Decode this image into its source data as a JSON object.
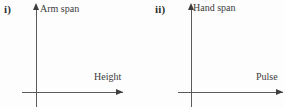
{
  "page": {
    "background_color": "#fdfdfd",
    "ink_color": "#3b3b3b",
    "axis_color": "#5a5a5a"
  },
  "panels": [
    {
      "marker": "i)",
      "y_axis_label": "Arm span",
      "x_axis_label": "Height",
      "y_arrow_icon": "arrow-up-icon",
      "x_arrow_icon": "arrow-right-icon"
    },
    {
      "marker": "ii)",
      "y_axis_label": "Hand span",
      "x_axis_label": "Pulse",
      "y_arrow_icon": "arrow-up-icon",
      "x_arrow_icon": "arrow-right-icon"
    }
  ],
  "chart_data": [
    {
      "type": "scatter",
      "title": "",
      "xlabel": "Height",
      "ylabel": "Arm span",
      "x": [],
      "y": [],
      "grid": false,
      "legend": "none",
      "note": "Empty axes template — no plotted data points"
    },
    {
      "type": "scatter",
      "title": "",
      "xlabel": "Pulse",
      "ylabel": "Hand span",
      "x": [],
      "y": [],
      "grid": false,
      "legend": "none",
      "note": "Empty axes template — no plotted data points"
    }
  ]
}
